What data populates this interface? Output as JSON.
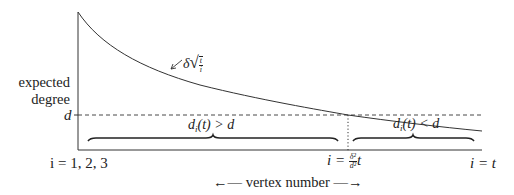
{
  "diagram": {
    "y_axis_label_line1": "expected",
    "y_axis_label_line2": "degree",
    "d_tick_label": "d",
    "curve_label": {
      "delta": "δ",
      "frac_num": "t",
      "frac_den": "i",
      "text": "δ√(t/i)"
    },
    "region_left_label": {
      "d": "d",
      "sub": "i",
      "rest": "(t) > d",
      "text": "d_i(t) > d"
    },
    "region_right_label": {
      "d": "d",
      "sub": "i",
      "rest": "(t) < d",
      "text": "d_i(t) < d"
    },
    "x_left_label": "i = 1, 2, 3",
    "x_mid_label": {
      "prefix": "i = ",
      "frac_num": "δ²",
      "frac_den": "d²",
      "suffix": "t",
      "text": "i = (δ²/d²) t"
    },
    "x_right_label": "i = t",
    "x_axis_caption": "←— vertex number —→",
    "colors": {
      "ink": "#222222",
      "background": "#ffffff"
    }
  }
}
